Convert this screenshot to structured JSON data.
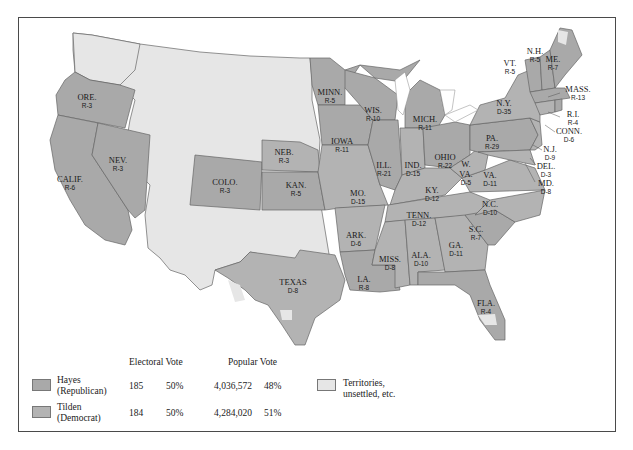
{
  "map": {
    "subject": "Presidential Election of 1876",
    "colors": {
      "hayes": "#a9a9a9",
      "tilden": "#b3b3b3",
      "territories": "#e6e6e6",
      "water": "#ffffff",
      "border": "#4a4a4a"
    },
    "states": [
      {
        "abbr": "ORE.",
        "vote": "R-3"
      },
      {
        "abbr": "CALIF.",
        "vote": "R-6"
      },
      {
        "abbr": "NEV.",
        "vote": "R-3"
      },
      {
        "abbr": "COLO.",
        "vote": "R-3"
      },
      {
        "abbr": "NEB.",
        "vote": "R-3"
      },
      {
        "abbr": "KAN.",
        "vote": "R-5"
      },
      {
        "abbr": "TEXAS",
        "vote": "D-8"
      },
      {
        "abbr": "MINN.",
        "vote": "R-5"
      },
      {
        "abbr": "IOWA",
        "vote": "R-11"
      },
      {
        "abbr": "MO.",
        "vote": "D-15"
      },
      {
        "abbr": "ARK.",
        "vote": "D-6"
      },
      {
        "abbr": "LA.",
        "vote": "R-8"
      },
      {
        "abbr": "WIS.",
        "vote": "R-10"
      },
      {
        "abbr": "ILL.",
        "vote": "R-21"
      },
      {
        "abbr": "MICH.",
        "vote": "R-11"
      },
      {
        "abbr": "IND.",
        "vote": "D-15"
      },
      {
        "abbr": "OHIO",
        "vote": "R-22"
      },
      {
        "abbr": "KY.",
        "vote": "D-12"
      },
      {
        "abbr": "TENN.",
        "vote": "D-12"
      },
      {
        "abbr": "MISS.",
        "vote": "D-8"
      },
      {
        "abbr": "ALA.",
        "vote": "D-10"
      },
      {
        "abbr": "GA.",
        "vote": "D-11"
      },
      {
        "abbr": "FLA.",
        "vote": "R-4"
      },
      {
        "abbr": "S.C.",
        "vote": "R-7"
      },
      {
        "abbr": "N.C.",
        "vote": "D-10"
      },
      {
        "abbr": "VA.",
        "vote": "D-11"
      },
      {
        "abbr": "W. VA.",
        "vote": "D-5"
      },
      {
        "abbr": "PA.",
        "vote": "R-29"
      },
      {
        "abbr": "N.Y.",
        "vote": "D-35"
      },
      {
        "abbr": "VT.",
        "vote": "R-5"
      },
      {
        "abbr": "N.H.",
        "vote": "R-5"
      },
      {
        "abbr": "ME.",
        "vote": "R-7"
      },
      {
        "abbr": "MASS.",
        "vote": "R-13"
      },
      {
        "abbr": "R.I.",
        "vote": "R-4"
      },
      {
        "abbr": "CONN.",
        "vote": "D-6"
      },
      {
        "abbr": "N.J.",
        "vote": "D-9"
      },
      {
        "abbr": "DEL.",
        "vote": "D-3"
      },
      {
        "abbr": "MD.",
        "vote": "D-8"
      }
    ]
  },
  "legend": {
    "col_headers": {
      "electoral": "Electoral Vote",
      "popular": "Popular Vote"
    },
    "rows": [
      {
        "name": "Hayes",
        "party": "(Republican)",
        "electoral_votes": "185",
        "electoral_pct": "50%",
        "popular_votes": "4,036,572",
        "popular_pct": "48%"
      },
      {
        "name": "Tilden",
        "party": "(Democrat)",
        "electoral_votes": "184",
        "electoral_pct": "50%",
        "popular_votes": "4,284,020",
        "popular_pct": "51%"
      }
    ],
    "territories": {
      "line1": "Territories,",
      "line2": "unsettled, etc."
    }
  }
}
